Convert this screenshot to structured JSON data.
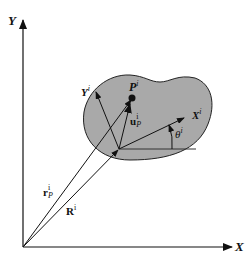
{
  "figure": {
    "colors": {
      "background": "#ffffff",
      "ink": "#111111",
      "body_fill": "#a9a9a9",
      "body_outline": "#222222"
    },
    "axes": {
      "x_label": "X",
      "y_label": "Y"
    },
    "body_frame": {
      "x_label_main": "X",
      "x_label_sup": "i",
      "y_label_main": "Y",
      "y_label_sup": "i",
      "angle_label_main": "θ",
      "angle_label_sup": "i"
    },
    "point": {
      "label_main": "P",
      "label_sup": "i"
    },
    "vectors": {
      "u": {
        "main": "u",
        "sup": "i",
        "sub": "P"
      },
      "r": {
        "main": "r",
        "sup": "i",
        "sub": "P"
      },
      "R": {
        "main": "R",
        "sup": "i"
      }
    }
  }
}
